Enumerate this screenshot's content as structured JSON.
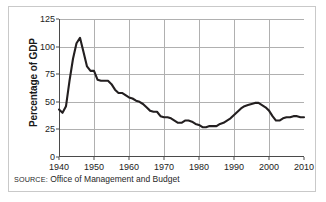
{
  "source": {
    "label": "SOURCE:",
    "text": "Office of Management and Budget"
  },
  "colors": {
    "line": "#231f20",
    "grid": "#b0b0b0",
    "axis": "#4a4a4a",
    "frame": "#c9c9c9",
    "text": "#222222",
    "background": "#ffffff"
  },
  "chart_data": {
    "type": "line",
    "title": "",
    "subtitle": "",
    "xlabel": "",
    "ylabel": "Percentage of GDP",
    "xlim": [
      1940,
      2010
    ],
    "ylim": [
      0,
      125
    ],
    "xticks": [
      1940,
      1950,
      1960,
      1970,
      1980,
      1990,
      2000,
      2010
    ],
    "xtick_labels": [
      "1940",
      "1950",
      "1960",
      "1970",
      "1980",
      "1990",
      "2000",
      "2010"
    ],
    "yticks": [
      0,
      25,
      50,
      75,
      100,
      125
    ],
    "ytick_labels": [
      "0",
      "25",
      "50",
      "75",
      "100",
      "125"
    ],
    "grid": true,
    "legend": false,
    "legend_position": "none",
    "annotations": [],
    "series": [
      {
        "name": "Federal debt held by the public as percentage of GDP",
        "x": [
          1940,
          1941,
          1942,
          1943,
          1944,
          1945,
          1946,
          1947,
          1948,
          1949,
          1950,
          1951,
          1952,
          1953,
          1954,
          1955,
          1956,
          1957,
          1958,
          1959,
          1960,
          1961,
          1962,
          1963,
          1964,
          1965,
          1966,
          1967,
          1968,
          1969,
          1970,
          1971,
          1972,
          1973,
          1974,
          1975,
          1976,
          1977,
          1978,
          1979,
          1980,
          1981,
          1982,
          1983,
          1984,
          1985,
          1986,
          1987,
          1988,
          1989,
          1990,
          1991,
          1992,
          1993,
          1994,
          1995,
          1996,
          1997,
          1998,
          1999,
          2000,
          2001,
          2002,
          2003,
          2004,
          2005,
          2006,
          2007,
          2008,
          2009,
          2010
        ],
        "values": [
          43,
          40,
          46,
          69,
          89,
          103,
          108,
          95,
          82,
          78,
          78,
          70,
          69,
          69,
          69,
          66,
          61,
          58,
          58,
          56,
          54,
          53,
          51,
          50,
          48,
          45,
          42,
          41,
          41,
          37,
          36,
          36,
          35,
          33,
          31,
          31,
          33,
          33,
          32,
          30,
          29,
          27,
          27,
          28,
          28,
          28,
          30,
          31,
          33,
          35,
          38,
          41,
          44,
          46,
          47,
          48,
          49,
          49,
          47,
          45,
          42,
          37,
          33,
          33,
          35,
          36,
          36,
          37,
          37,
          36,
          36
        ]
      }
    ]
  }
}
